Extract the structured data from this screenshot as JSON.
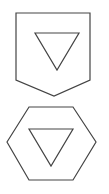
{
  "diagram": {
    "stroke_color": "#444444",
    "background": "#ffffff",
    "shapes": [
      {
        "name": "shield-with-down-triangle",
        "outer": "pentagon-shield",
        "inner": "downward-triangle"
      },
      {
        "name": "hexagon-with-down-triangle",
        "outer": "hexagon",
        "inner": "downward-triangle"
      }
    ]
  }
}
